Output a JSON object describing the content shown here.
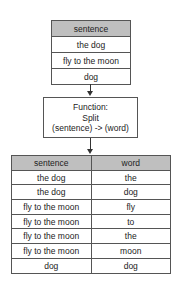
{
  "input_table": {
    "header": "sentence",
    "rows": [
      "the dog",
      "fly to the moon",
      "dog"
    ]
  },
  "function_box": {
    "line1": "Function:",
    "line2": "Split",
    "line3": "(sentence) -> (word)"
  },
  "output_table": {
    "headers": [
      "sentence",
      "word"
    ],
    "rows": [
      [
        "the dog",
        "the"
      ],
      [
        "the dog",
        "dog"
      ],
      [
        "fly to the moon",
        "fly"
      ],
      [
        "fly to the moon",
        "to"
      ],
      [
        "fly to the moon",
        "the"
      ],
      [
        "fly to the moon",
        "moon"
      ],
      [
        "dog",
        "dog"
      ]
    ]
  }
}
